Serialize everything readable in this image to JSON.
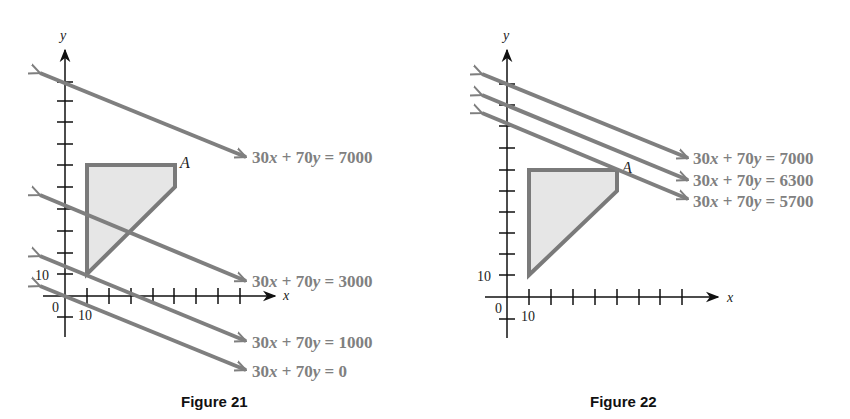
{
  "figures": [
    {
      "id": "fig21",
      "caption": "Figure 21",
      "axes": {
        "x_label": "x",
        "y_label": "y",
        "origin_label": "0",
        "x_tick_label": "10",
        "y_tick_label": "10",
        "tick_step": 10
      },
      "feasible_region": {
        "vertices": [
          [
            10,
            10
          ],
          [
            10,
            60
          ],
          [
            50,
            60
          ],
          [
            50,
            50
          ]
        ],
        "fill": "#e6e6e6",
        "stroke": "#7a7a7a"
      },
      "vertex_label": {
        "text": "A",
        "point": [
          50,
          60
        ]
      },
      "lines": [
        {
          "equation": "30x + 70y = 7000",
          "lhs_a": "30",
          "lhs_b": "70",
          "rhs": "7000"
        },
        {
          "equation": "30x + 70y = 3000",
          "lhs_a": "30",
          "lhs_b": "70",
          "rhs": "3000"
        },
        {
          "equation": "30x + 70y = 1000",
          "lhs_a": "30",
          "lhs_b": "70",
          "rhs": "1000"
        },
        {
          "equation": "30x + 70y = 0",
          "lhs_a": "30",
          "lhs_b": "70",
          "rhs": "0"
        }
      ]
    },
    {
      "id": "fig22",
      "caption": "Figure 22",
      "axes": {
        "x_label": "x",
        "y_label": "y",
        "origin_label": "0",
        "x_tick_label": "10",
        "y_tick_label": "10",
        "tick_step": 10
      },
      "feasible_region": {
        "vertices": [
          [
            10,
            10
          ],
          [
            10,
            60
          ],
          [
            50,
            60
          ],
          [
            50,
            50
          ]
        ],
        "fill": "#e6e6e6",
        "stroke": "#7a7a7a"
      },
      "vertex_label": {
        "text": "A",
        "point": [
          50,
          60
        ]
      },
      "lines": [
        {
          "equation": "30x + 70y = 7000",
          "lhs_a": "30",
          "lhs_b": "70",
          "rhs": "7000"
        },
        {
          "equation": "30x + 70y = 6300",
          "lhs_a": "30",
          "lhs_b": "70",
          "rhs": "6300"
        },
        {
          "equation": "30x + 70y = 5700",
          "lhs_a": "30",
          "lhs_b": "70",
          "rhs": "5700"
        }
      ]
    }
  ],
  "colors": {
    "line": "#7f7f7f",
    "axis": "#111111",
    "region_fill": "#e6e6e6",
    "region_stroke": "#7a7a7a",
    "label": "#808080"
  }
}
